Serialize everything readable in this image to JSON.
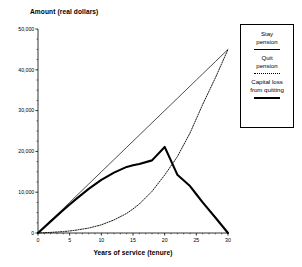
{
  "chart_data": {
    "type": "line",
    "title": "",
    "ylabel": "Amount (real dollars)",
    "xlabel": "Years of service (tenure)",
    "xlim": [
      0,
      30
    ],
    "ylim": [
      0,
      50000
    ],
    "grid": false,
    "legend_position": "right",
    "xticks": [
      0,
      5,
      10,
      15,
      20,
      25,
      30
    ],
    "xtick_labels": [
      "0",
      "5",
      "10",
      "15",
      "20",
      "25",
      "30"
    ],
    "yticks": [
      0,
      10000,
      20000,
      30000,
      40000,
      50000
    ],
    "ytick_labels": [
      "0",
      "10,000",
      "20,000",
      "30,000",
      "40,000",
      "50,000"
    ],
    "x": [
      0,
      2,
      4,
      5,
      6,
      8,
      10,
      12,
      14,
      15,
      16,
      18,
      20,
      22,
      24,
      25,
      26,
      28,
      30
    ],
    "series": [
      {
        "name": "Stay pension",
        "style": "thin-solid",
        "values": [
          0,
          3000,
          6000,
          7500,
          9000,
          12000,
          15000,
          18000,
          21000,
          22500,
          24000,
          27000,
          30000,
          33000,
          36000,
          37500,
          39000,
          42000,
          45000
        ]
      },
      {
        "name": "Quit pension",
        "style": "dotted",
        "values": [
          0,
          150,
          350,
          500,
          700,
          1200,
          2000,
          3200,
          4800,
          5900,
          7100,
          10200,
          14200,
          18700,
          24500,
          28000,
          31500,
          38000,
          45000
        ]
      },
      {
        "name": "Capital loss from quitting",
        "style": "thick-solid",
        "values": [
          0,
          2850,
          5650,
          7000,
          8300,
          10800,
          13000,
          14800,
          16200,
          16600,
          16900,
          17800,
          21100,
          14300,
          11500,
          9500,
          7500,
          3800,
          0
        ]
      }
    ]
  },
  "legend": {
    "entries": [
      {
        "label": "Stay\npension",
        "swatch": "thin-solid"
      },
      {
        "label": "Quit\npension",
        "swatch": "dotted"
      },
      {
        "label": "Capital loss\nfrom quitting",
        "swatch": "thick-solid"
      }
    ]
  }
}
